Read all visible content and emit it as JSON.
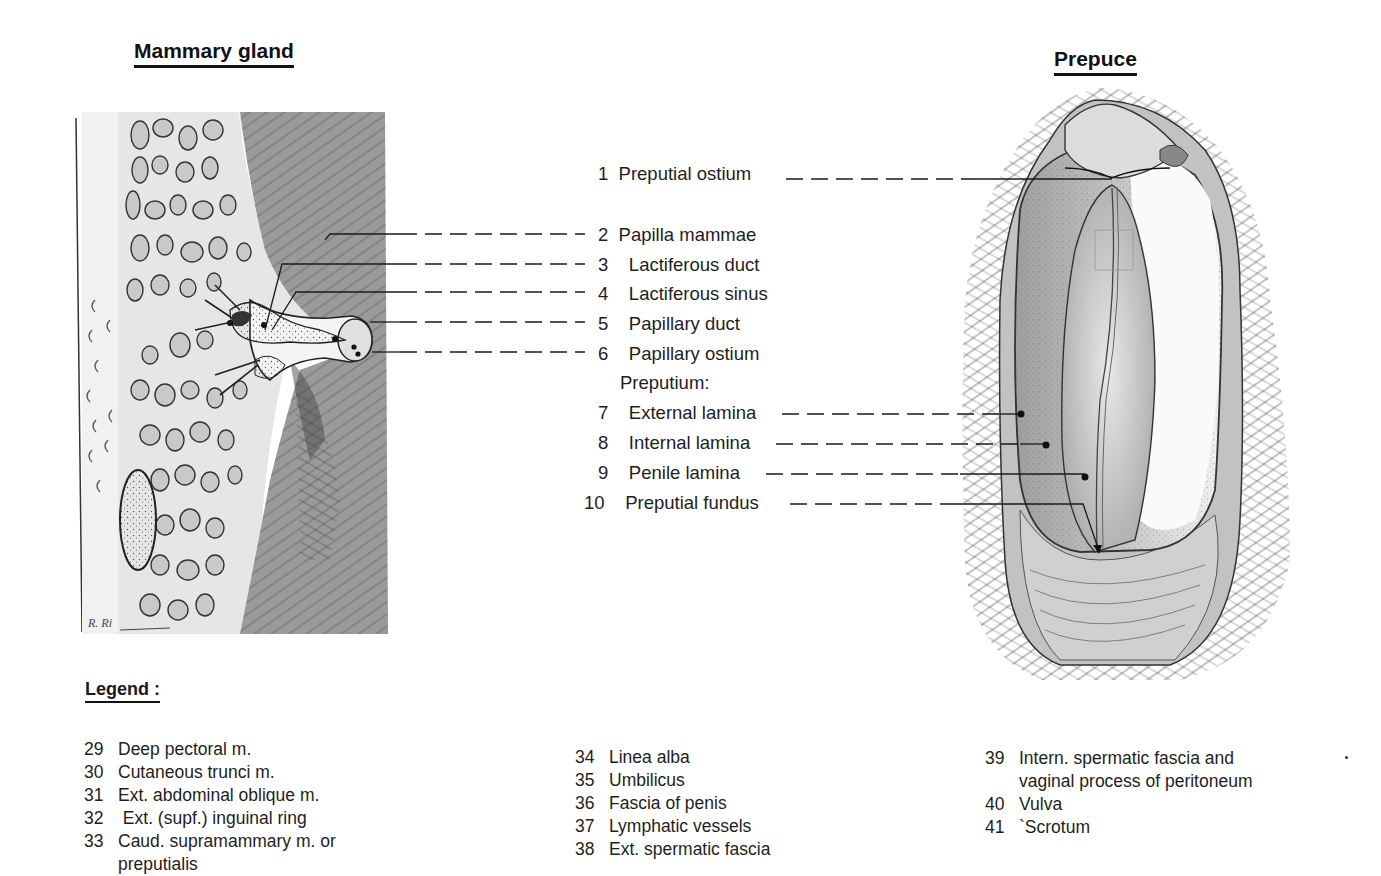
{
  "figures": {
    "mammary": {
      "title": "Mammary gland",
      "signature": "R. Ri"
    },
    "prepuce": {
      "title": "Prepuce"
    }
  },
  "labels": [
    {
      "num": "1",
      "text": "Preputial ostium"
    },
    {
      "num": "2",
      "text": "Papilla mammae"
    },
    {
      "num": "3",
      "text": "Lactiferous duct"
    },
    {
      "num": "4",
      "text": "Lactiferous sinus"
    },
    {
      "num": "5",
      "text": "Papillary duct"
    },
    {
      "num": "6",
      "text": "Papillary ostium"
    },
    {
      "num": "",
      "text": "Preputium:"
    },
    {
      "num": "7",
      "text": "External lamina"
    },
    {
      "num": "8",
      "text": "Internal lamina"
    },
    {
      "num": "9",
      "text": "Penile lamina"
    },
    {
      "num": "10",
      "text": "Preputial fundus"
    }
  ],
  "legend": {
    "title": "Legend :",
    "columns": [
      [
        {
          "num": "29",
          "text": "Deep pectoral m."
        },
        {
          "num": "30",
          "text": "Cutaneous trunci m."
        },
        {
          "num": "31",
          "text": "Ext. abdominal oblique m."
        },
        {
          "num": "32",
          "text": " Ext. (supf.) inguinal ring"
        },
        {
          "num": "33",
          "text": "Caud. supramammary m. or",
          "cont": "preputialis"
        }
      ],
      [
        {
          "num": "34",
          "text": "Linea alba"
        },
        {
          "num": "35",
          "text": "Umbilicus"
        },
        {
          "num": "36",
          "text": "Fascia of penis"
        },
        {
          "num": "37",
          "text": "Lymphatic vessels"
        },
        {
          "num": "38",
          "text": "Ext. spermatic fascia"
        }
      ],
      [
        {
          "num": "39",
          "text": "Intern. spermatic fascia and",
          "cont": "vaginal process of peritoneum"
        },
        {
          "num": "40",
          "text": "Vulva"
        },
        {
          "num": "41",
          "text": "`Scrotum"
        }
      ]
    ]
  },
  "colors": {
    "ink": "#1a1a1a",
    "tissue_gray": "#b8b8b8",
    "dark_hair": "#555555",
    "paper": "#ffffff"
  }
}
